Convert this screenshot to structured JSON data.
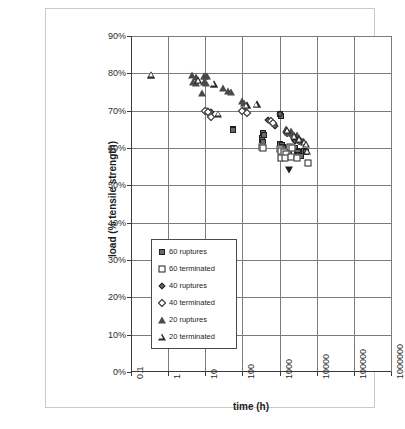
{
  "chart_data": {
    "type": "scatter",
    "title": "",
    "xlabel": "time (h)",
    "ylabel": "load (% tensile strength)",
    "xscale": "log",
    "xlim": [
      0.1,
      1000000
    ],
    "ylim": [
      0,
      0.9
    ],
    "xticklabels": [
      "0.1",
      "1",
      "10",
      "100",
      "1000",
      "10000",
      "100000",
      "1000000"
    ],
    "yticklabels": [
      "0%",
      "10%",
      "20%",
      "30%",
      "40%",
      "50%",
      "60%",
      "70%",
      "80%",
      "90%"
    ],
    "grid": true,
    "legend_position": "inside-lower-left",
    "series": [
      {
        "name": "60 ruptures",
        "marker": "filled-square",
        "points": [
          [
            55,
            0.652
          ],
          [
            57,
            0.648
          ],
          [
            330,
            0.628
          ],
          [
            340,
            0.622
          ],
          [
            350,
            0.616
          ],
          [
            360,
            0.64
          ],
          [
            380,
            0.634
          ],
          [
            1050,
            0.612
          ],
          [
            1150,
            0.608
          ],
          [
            1250,
            0.604
          ],
          [
            1500,
            0.6
          ],
          [
            1700,
            0.596
          ],
          [
            1850,
            0.592
          ],
          [
            2600,
            0.6
          ],
          [
            2900,
            0.592
          ],
          [
            3100,
            0.588
          ],
          [
            3400,
            0.582
          ],
          [
            3800,
            0.578
          ],
          [
            4600,
            0.592
          ],
          [
            5200,
            0.588
          ],
          [
            1000,
            0.69
          ],
          [
            1100,
            0.686
          ]
        ]
      },
      {
        "name": "60 terminated",
        "marker": "open-square",
        "points": [
          [
            340,
            0.604
          ],
          [
            360,
            0.6
          ],
          [
            1000,
            0.596
          ],
          [
            1100,
            0.592
          ],
          [
            1300,
            0.588
          ],
          [
            1500,
            0.584
          ],
          [
            1100,
            0.572
          ],
          [
            1400,
            0.572
          ],
          [
            2000,
            0.576
          ],
          [
            3000,
            0.572
          ],
          [
            6000,
            0.56
          ],
          [
            1900,
            0.604
          ],
          [
            2100,
            0.6
          ]
        ]
      },
      {
        "name": "40 ruptures",
        "marker": "filled-diamond",
        "points": [
          [
            11,
            0.7
          ],
          [
            12,
            0.698
          ],
          [
            14,
            0.696
          ],
          [
            13,
            0.688
          ],
          [
            100,
            0.7
          ],
          [
            115,
            0.698
          ],
          [
            500,
            0.676
          ],
          [
            560,
            0.672
          ],
          [
            620,
            0.668
          ],
          [
            700,
            0.664
          ],
          [
            760,
            0.66
          ],
          [
            1000,
            0.69
          ],
          [
            2400,
            0.624
          ],
          [
            2600,
            0.618
          ]
        ]
      },
      {
        "name": "40 terminated",
        "marker": "open-diamond",
        "points": [
          [
            10,
            0.7
          ],
          [
            12,
            0.696
          ],
          [
            14,
            0.684
          ],
          [
            95,
            0.7
          ],
          [
            130,
            0.694
          ],
          [
            600,
            0.672
          ],
          [
            680,
            0.666
          ],
          [
            1600,
            0.64
          ],
          [
            2300,
            0.632
          ],
          [
            2700,
            0.628
          ],
          [
            3100,
            0.624
          ],
          [
            3400,
            0.618
          ]
        ]
      },
      {
        "name": "20 ruptures",
        "marker": "filled-triangle",
        "points": [
          [
            0.35,
            0.796
          ],
          [
            4.5,
            0.796
          ],
          [
            5.5,
            0.79
          ],
          [
            6.5,
            0.782
          ],
          [
            4.8,
            0.776
          ],
          [
            5.8,
            0.774
          ],
          [
            9,
            0.794
          ],
          [
            10,
            0.794
          ],
          [
            11,
            0.792
          ],
          [
            9.5,
            0.776
          ],
          [
            10.5,
            0.774
          ],
          [
            8,
            0.748
          ],
          [
            17,
            0.772
          ],
          [
            30,
            0.76
          ],
          [
            42,
            0.752
          ],
          [
            48,
            0.75
          ],
          [
            95,
            0.726
          ],
          [
            110,
            0.72
          ],
          [
            130,
            0.714
          ],
          [
            240,
            0.718
          ],
          [
            1500,
            0.652
          ],
          [
            1700,
            0.644
          ],
          [
            2000,
            0.646
          ],
          [
            2200,
            0.64
          ],
          [
            2400,
            0.634
          ],
          [
            3000,
            0.636
          ],
          [
            3300,
            0.628
          ],
          [
            3600,
            0.622
          ],
          [
            4200,
            0.618
          ]
        ]
      },
      {
        "name": "20 terminated",
        "marker": "open-triangle",
        "points": [
          [
            0.35,
            0.796
          ],
          [
            6.5,
            0.782
          ],
          [
            17,
            0.772
          ],
          [
            22,
            0.692
          ],
          [
            130,
            0.714
          ],
          [
            240,
            0.718
          ],
          [
            1600,
            0.648
          ],
          [
            2600,
            0.63
          ],
          [
            3400,
            0.624
          ],
          [
            4600,
            0.616
          ],
          [
            5200,
            0.61
          ],
          [
            5600,
            0.592
          ]
        ]
      },
      {
        "name": "outlier",
        "marker": "filled-down-triangle",
        "points": [
          [
            1800,
            0.54
          ]
        ]
      }
    ]
  },
  "legend": {
    "items": [
      {
        "label": "60 ruptures",
        "marker": "filled-square"
      },
      {
        "label": "60 terminated",
        "marker": "open-square"
      },
      {
        "label": "40 ruptures",
        "marker": "filled-diamond"
      },
      {
        "label": "40 terminated",
        "marker": "open-diamond"
      },
      {
        "label": "20 ruptures",
        "marker": "filled-triangle"
      },
      {
        "label": "20 terminated",
        "marker": "open-triangle"
      }
    ]
  }
}
